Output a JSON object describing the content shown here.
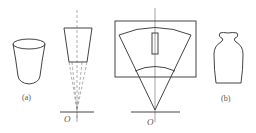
{
  "figure": {
    "labels": {
      "cup": "(a)",
      "vase": "(b)",
      "origin_left": "O",
      "origin_right": "O"
    },
    "colors": {
      "line": "#444444",
      "background": "#ffffff"
    }
  }
}
